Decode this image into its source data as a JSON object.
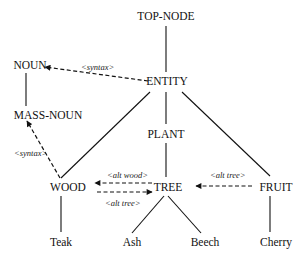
{
  "diagram": {
    "nodes": {
      "top_node": "TOP-NODE",
      "entity": "ENTITY",
      "noun": "NOUN",
      "mass_noun": "MASS-NOUN",
      "plant": "PLANT",
      "wood": "WOOD",
      "tree": "TREE",
      "fruit": "FRUIT",
      "teak": "Teak",
      "ash": "Ash",
      "beech": "Beech",
      "cherry": "Cherry"
    },
    "edge_labels": {
      "entity_to_noun": "<syntax>",
      "wood_to_mass_noun": "<syntax>",
      "tree_to_wood": "<alt wood>",
      "wood_to_tree": "<alt tree>",
      "fruit_to_tree": "<alt tree>"
    },
    "hierarchy_edges": [
      [
        "TOP-NODE",
        "ENTITY"
      ],
      [
        "ENTITY",
        "WOOD"
      ],
      [
        "ENTITY",
        "PLANT"
      ],
      [
        "ENTITY",
        "FRUIT"
      ],
      [
        "PLANT",
        "TREE"
      ],
      [
        "NOUN",
        "MASS-NOUN"
      ],
      [
        "WOOD",
        "Teak"
      ],
      [
        "TREE",
        "Ash"
      ],
      [
        "TREE",
        "Beech"
      ],
      [
        "FRUIT",
        "Cherry"
      ]
    ],
    "relation_edges": [
      {
        "from": "ENTITY",
        "to": "NOUN",
        "label": "<syntax>"
      },
      {
        "from": "WOOD",
        "to": "MASS-NOUN",
        "label": "<syntax>"
      },
      {
        "from": "TREE",
        "to": "WOOD",
        "label": "<alt wood>"
      },
      {
        "from": "WOOD",
        "to": "TREE",
        "label": "<alt tree>"
      },
      {
        "from": "FRUIT",
        "to": "TREE",
        "label": "<alt tree>"
      }
    ]
  }
}
